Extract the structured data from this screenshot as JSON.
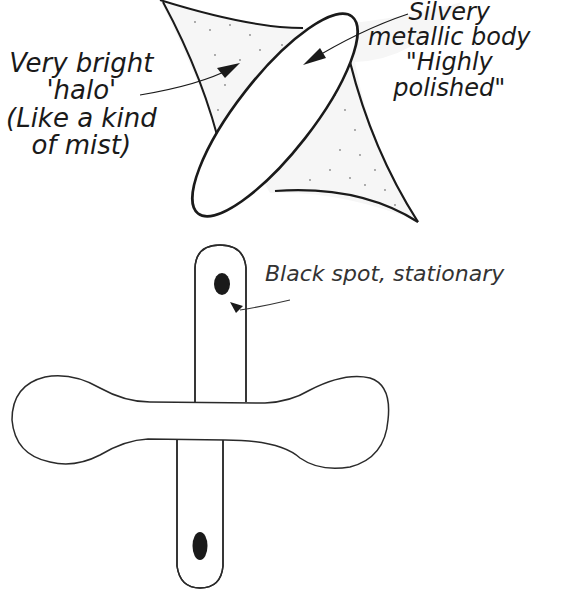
{
  "figure": {
    "upper_sketch": {
      "description": "Tilted elliptical object surrounded by a four-pointed stippled halo",
      "labels": {
        "halo": [
          "Very bright",
          "'halo'",
          "(Like a kind",
          "of mist)"
        ],
        "body": [
          "Silvery",
          "metallic body",
          "\"Highly",
          "polished\""
        ]
      }
    },
    "lower_sketch": {
      "description": "Cross-shaped object: vertical rounded bar crossed by horizontal dumbbell shape, with two black spots",
      "labels": {
        "spot": "Black spot, stationary"
      }
    },
    "colors": {
      "ink": "#1a1a1a",
      "background": "#ffffff",
      "stipple": "#8a8a8a"
    }
  }
}
